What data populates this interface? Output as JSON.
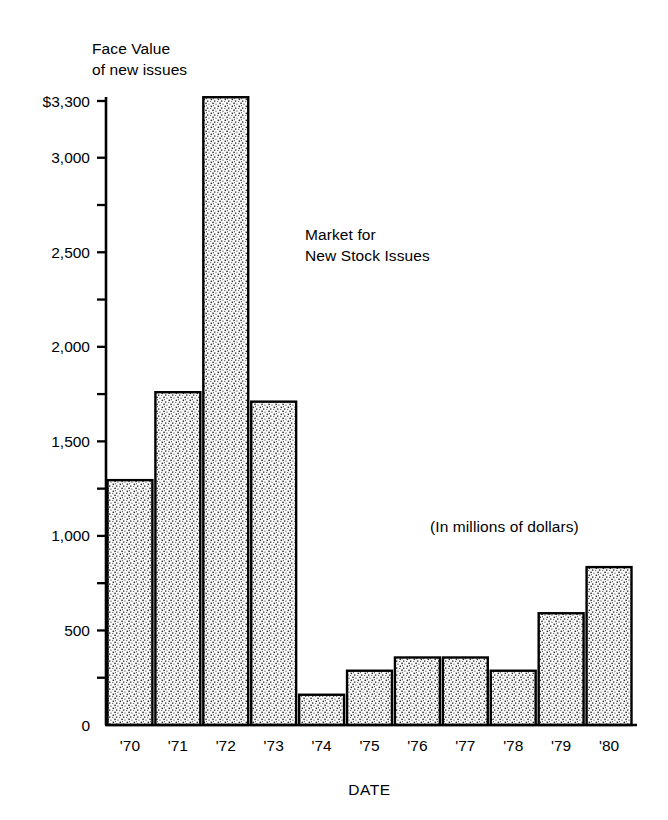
{
  "chart_data": {
    "type": "bar",
    "title": "Market for\nNew Stock Issues",
    "title_line1": "Market for",
    "title_line2": "New Stock Issues",
    "subtitle": "(In millions of dollars)",
    "ylabel": "Face Value\nof new issues",
    "ylabel_line1": "Face Value",
    "ylabel_line2": "of new issues",
    "xlabel": "DATE",
    "categories": [
      "'70",
      "'71",
      "'72",
      "'73",
      "'74",
      "'75",
      "'76",
      "'77",
      "'78",
      "'79",
      "'80"
    ],
    "values": [
      1295,
      1760,
      3320,
      1710,
      160,
      287,
      357,
      357,
      287,
      591,
      835
    ],
    "ylim": [
      0,
      3300
    ],
    "xlim_note": "categorical, 11 adjacent bars",
    "ytick_values": [
      0,
      250,
      500,
      750,
      1000,
      1250,
      1500,
      1750,
      2000,
      2250,
      2500,
      2750,
      3000,
      3300
    ],
    "ytick_labeled_values": [
      0,
      500,
      1000,
      1500,
      2000,
      2500,
      3000,
      3300
    ],
    "ytick_labels": [
      "0",
      "500",
      "1,000",
      "1,500",
      "2,000",
      "2,500",
      "3,000",
      "$3,300"
    ],
    "grid": false,
    "legend": false,
    "legend_position": "none",
    "bar_fill": "stipple",
    "bar_fill_color": "#ffffff",
    "bar_edge_color": "#000000",
    "axis_color": "#000000",
    "background_color": "#ffffff"
  },
  "geometry": {
    "plot_left": 106,
    "plot_right": 633,
    "plot_bottom": 725,
    "plot_top": 101,
    "bar_gap_px": 3
  }
}
